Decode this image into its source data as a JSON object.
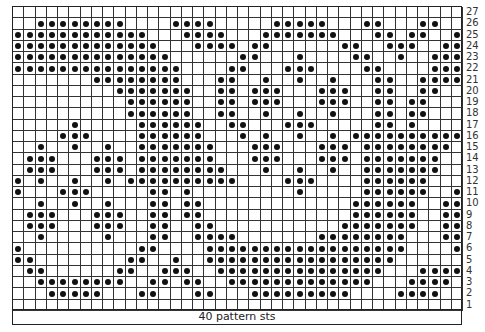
{
  "chart": {
    "columns": 40,
    "rows": 27,
    "footer_label": "40 pattern sts",
    "colors": {
      "grid": "#333333",
      "dot": "#111111",
      "background": "#ffffff"
    },
    "row_dots": {
      "27": [],
      "26": [
        3,
        4,
        5,
        6,
        7,
        8,
        9,
        10,
        15,
        16,
        17,
        18,
        24,
        25,
        26,
        27,
        28,
        32,
        33,
        37,
        38
      ],
      "25": [
        1,
        2,
        3,
        4,
        5,
        6,
        7,
        8,
        9,
        10,
        11,
        12,
        16,
        17,
        18,
        19,
        23,
        24,
        25,
        26,
        27,
        28,
        29,
        33,
        34,
        36,
        37,
        40
      ],
      "24": [
        1,
        2,
        3,
        4,
        5,
        6,
        7,
        8,
        9,
        10,
        11,
        12,
        13,
        17,
        18,
        19,
        20,
        22,
        23,
        30,
        31,
        34,
        35,
        36,
        39,
        40
      ],
      "23": [
        1,
        2,
        3,
        4,
        5,
        6,
        7,
        8,
        9,
        10,
        11,
        12,
        13,
        14,
        21,
        22,
        26,
        31,
        32,
        35,
        38,
        39,
        40
      ],
      "22": [
        1,
        2,
        3,
        4,
        5,
        6,
        7,
        8,
        9,
        10,
        11,
        12,
        13,
        14,
        15,
        20,
        21,
        25,
        26,
        27,
        32,
        33,
        38,
        39,
        40
      ],
      "21": [
        8,
        9,
        10,
        11,
        12,
        13,
        14,
        15,
        19,
        20,
        23,
        26,
        29,
        33,
        34,
        37,
        38,
        39,
        40
      ],
      "20": [
        10,
        11,
        12,
        13,
        14,
        15,
        16,
        19,
        20,
        22,
        23,
        24,
        28,
        29,
        30,
        33,
        34,
        37,
        38
      ],
      "19": [
        11,
        12,
        13,
        14,
        15,
        16,
        19,
        20,
        22,
        23,
        24,
        28,
        29,
        30,
        33,
        34,
        36,
        37
      ],
      "18": [
        11,
        12,
        13,
        14,
        15,
        16,
        19,
        20,
        23,
        26,
        29,
        33,
        34,
        36,
        37
      ],
      "17": [
        6,
        12,
        13,
        14,
        15,
        16,
        17,
        20,
        21,
        25,
        26,
        27,
        33,
        34,
        36
      ],
      "16": [
        5,
        6,
        7,
        12,
        13,
        14,
        15,
        16,
        17,
        21,
        23,
        26,
        29,
        31,
        32,
        33,
        34,
        35,
        36,
        37,
        38,
        39,
        40
      ],
      "15": [
        3,
        6,
        9,
        12,
        13,
        14,
        15,
        16,
        17,
        18,
        22,
        23,
        24,
        28,
        29,
        30,
        32,
        33,
        34,
        35,
        36,
        37,
        38,
        39
      ],
      "14": [
        2,
        3,
        4,
        8,
        9,
        10,
        12,
        13,
        14,
        15,
        16,
        17,
        18,
        22,
        23,
        24,
        28,
        29,
        30,
        32,
        33,
        34,
        35,
        36,
        37,
        38
      ],
      "13": [
        2,
        3,
        4,
        8,
        9,
        10,
        12,
        13,
        14,
        15,
        16,
        17,
        18,
        19,
        23,
        26,
        29,
        32,
        33,
        34,
        35,
        36,
        37,
        38
      ],
      "12": [
        1,
        3,
        6,
        9,
        11,
        12,
        13,
        14,
        15,
        16,
        17,
        18,
        19,
        20,
        25,
        26,
        27,
        32,
        33,
        34,
        35,
        36,
        37
      ],
      "11": [
        1,
        5,
        6,
        7,
        13,
        14,
        16,
        26,
        32,
        33,
        34,
        35,
        36,
        37,
        40
      ],
      "10": [
        3,
        6,
        9,
        13,
        14,
        16,
        17,
        31,
        32,
        33,
        34,
        35,
        36,
        39,
        40
      ],
      "9": [
        2,
        3,
        4,
        8,
        9,
        10,
        13,
        14,
        16,
        17,
        31,
        32,
        33,
        34,
        35,
        36,
        39,
        40
      ],
      "8": [
        2,
        3,
        4,
        8,
        9,
        10,
        13,
        14,
        17,
        18,
        30,
        31,
        32,
        33,
        34,
        35,
        36,
        39,
        40
      ],
      "7": [
        3,
        9,
        13,
        14,
        17,
        18,
        19,
        20,
        28,
        29,
        30,
        31,
        32,
        33,
        34,
        35,
        39,
        40
      ],
      "6": [
        1,
        12,
        13,
        18,
        19,
        20,
        21,
        22,
        23,
        24,
        25,
        26,
        27,
        28,
        29,
        30,
        31,
        32,
        33,
        34,
        35,
        40
      ],
      "5": [
        1,
        2,
        11,
        12,
        15,
        18,
        19,
        20,
        21,
        22,
        23,
        24,
        25,
        26,
        27,
        28,
        29,
        30,
        31,
        32,
        33,
        34
      ],
      "4": [
        2,
        3,
        10,
        11,
        14,
        15,
        16,
        19,
        20,
        21,
        22,
        23,
        24,
        25,
        26,
        27,
        28,
        29,
        30,
        31,
        32,
        33,
        37,
        38,
        39,
        40
      ],
      "3": [
        3,
        4,
        5,
        6,
        7,
        8,
        9,
        10,
        13,
        14,
        16,
        17,
        20,
        21,
        22,
        23,
        24,
        25,
        26,
        27,
        28,
        29,
        30,
        31,
        32,
        36,
        37,
        38,
        39
      ],
      "2": [
        4,
        5,
        6,
        7,
        8,
        12,
        13,
        17,
        18,
        22,
        23,
        24,
        25,
        26,
        27,
        28,
        29,
        30,
        35,
        36,
        37,
        38
      ],
      "1": []
    }
  }
}
